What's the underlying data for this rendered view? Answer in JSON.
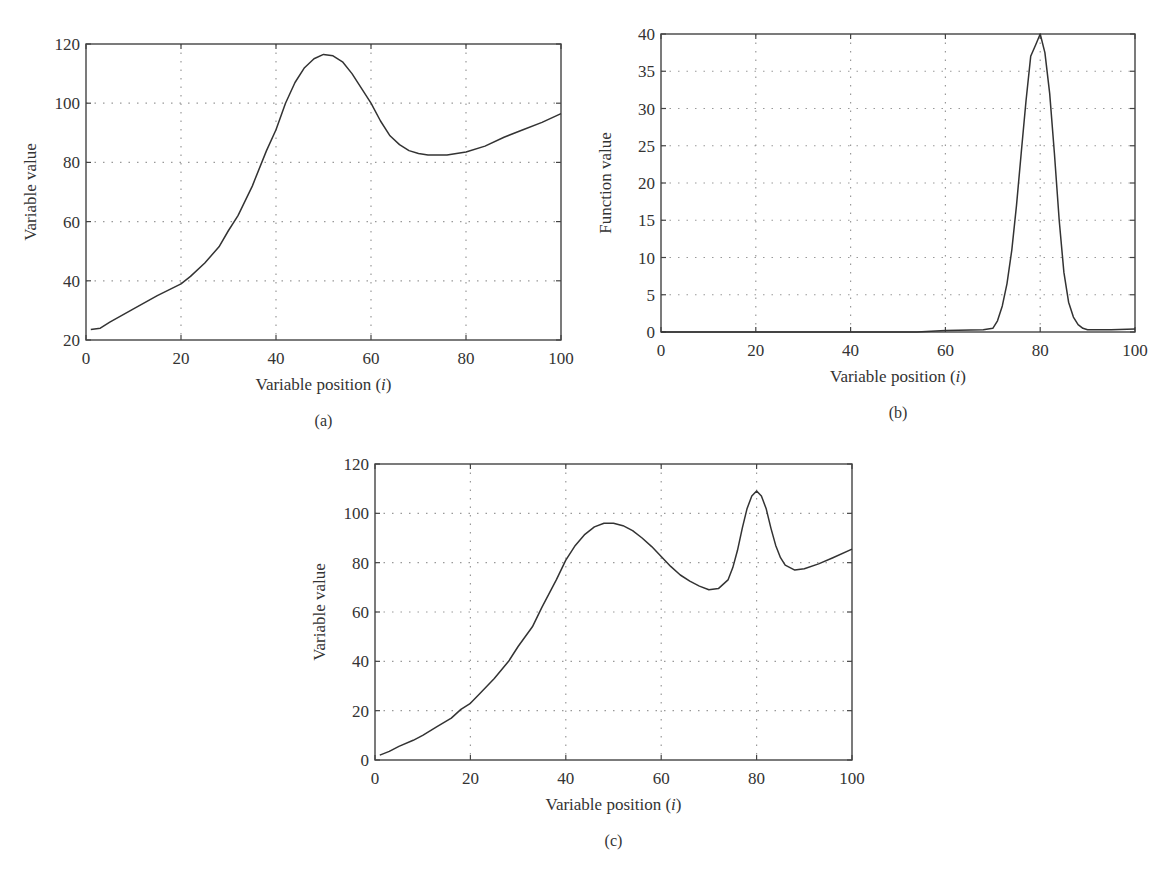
{
  "chart_data": [
    {
      "id": "a",
      "type": "line",
      "panel_label": "(a)",
      "title": "",
      "xlabel": "Variable position (i)",
      "xlabel_main": "Variable position (",
      "xlabel_var": "i",
      "xlabel_close": ")",
      "ylabel": "Variable value",
      "xlim": [
        0,
        100
      ],
      "ylim": [
        20,
        120
      ],
      "xticks": [
        0,
        20,
        40,
        60,
        80,
        100
      ],
      "yticks": [
        20,
        40,
        60,
        80,
        100,
        120
      ],
      "grid": true,
      "box": {
        "x0": 86,
        "x1": 561,
        "y0": 340,
        "y1": 44
      },
      "series": [
        {
          "name": "variable",
          "x": [
            1,
            3,
            5,
            10,
            15,
            20,
            22,
            25,
            28,
            30,
            32,
            35,
            38,
            40,
            42,
            44,
            46,
            48,
            50,
            52,
            54,
            56,
            58,
            60,
            62,
            64,
            66,
            68,
            70,
            72,
            74,
            76,
            78,
            80,
            84,
            88,
            92,
            96,
            100
          ],
          "values": [
            23.5,
            24,
            26,
            30.5,
            35,
            39,
            41.5,
            46,
            51.5,
            57,
            62,
            72,
            84,
            91,
            100,
            107,
            112,
            115,
            116.5,
            116,
            114,
            110,
            105,
            100,
            94,
            89,
            86,
            84,
            83,
            82.5,
            82.5,
            82.5,
            83,
            83.5,
            85.5,
            88.5,
            91,
            93.5,
            96.5
          ]
        }
      ]
    },
    {
      "id": "b",
      "type": "line",
      "panel_label": "(b)",
      "title": "",
      "xlabel": "Variable position (i)",
      "xlabel_main": "Variable position (",
      "xlabel_var": "i",
      "xlabel_close": ")",
      "ylabel": "Function value",
      "xlim": [
        0,
        100
      ],
      "ylim": [
        0,
        40
      ],
      "xticks": [
        0,
        20,
        40,
        60,
        80,
        100
      ],
      "yticks": [
        0,
        5,
        10,
        15,
        20,
        25,
        30,
        35,
        40
      ],
      "grid": true,
      "box": {
        "x0": 661,
        "x1": 1135,
        "y0": 332,
        "y1": 34
      },
      "series": [
        {
          "name": "function",
          "x": [
            0,
            54,
            60,
            68,
            70,
            71,
            72,
            73,
            74,
            75,
            76,
            77,
            78,
            79,
            80,
            81,
            82,
            83,
            84,
            85,
            86,
            87,
            88,
            89,
            90,
            95,
            100
          ],
          "values": [
            0,
            0,
            0.2,
            0.3,
            0.5,
            1.5,
            3.5,
            6.5,
            11,
            17,
            24,
            31,
            37,
            38.5,
            40,
            37.5,
            32,
            24,
            15,
            8,
            4,
            2,
            1,
            0.5,
            0.3,
            0.3,
            0.4
          ]
        }
      ]
    },
    {
      "id": "c",
      "type": "line",
      "panel_label": "(c)",
      "title": "",
      "xlabel": "Variable position (i)",
      "xlabel_main": "Variable position (",
      "xlabel_var": "i",
      "xlabel_close": ")",
      "ylabel": "Variable value",
      "xlim": [
        0,
        100
      ],
      "ylim": [
        0,
        120
      ],
      "xticks": [
        0,
        20,
        40,
        60,
        80,
        100
      ],
      "yticks": [
        0,
        20,
        40,
        60,
        80,
        100,
        120
      ],
      "grid": true,
      "box": {
        "x0": 375,
        "x1": 852,
        "y0": 760,
        "y1": 464
      },
      "series": [
        {
          "name": "variable",
          "x": [
            1,
            3,
            5,
            8,
            10,
            13,
            16,
            18,
            20,
            22,
            25,
            28,
            30,
            33,
            35,
            38,
            40,
            42,
            44,
            46,
            48,
            50,
            52,
            54,
            56,
            58,
            60,
            62,
            64,
            66,
            68,
            70,
            72,
            74,
            75,
            76,
            77,
            78,
            79,
            80,
            81,
            82,
            83,
            84,
            85,
            86,
            88,
            90,
            93,
            96,
            100
          ],
          "values": [
            2,
            3.5,
            5.5,
            8,
            10,
            13.5,
            17,
            20.5,
            23,
            27,
            33,
            40,
            46,
            54,
            62,
            73,
            81,
            87,
            91.5,
            94.5,
            96,
            96,
            95,
            93,
            90,
            86.5,
            82.5,
            78.5,
            75,
            72.5,
            70.5,
            69,
            69.5,
            73,
            78,
            85,
            94,
            102,
            107,
            109,
            107,
            102,
            94,
            87,
            82,
            79,
            77,
            77.5,
            79.5,
            82,
            85.5
          ]
        }
      ]
    }
  ]
}
